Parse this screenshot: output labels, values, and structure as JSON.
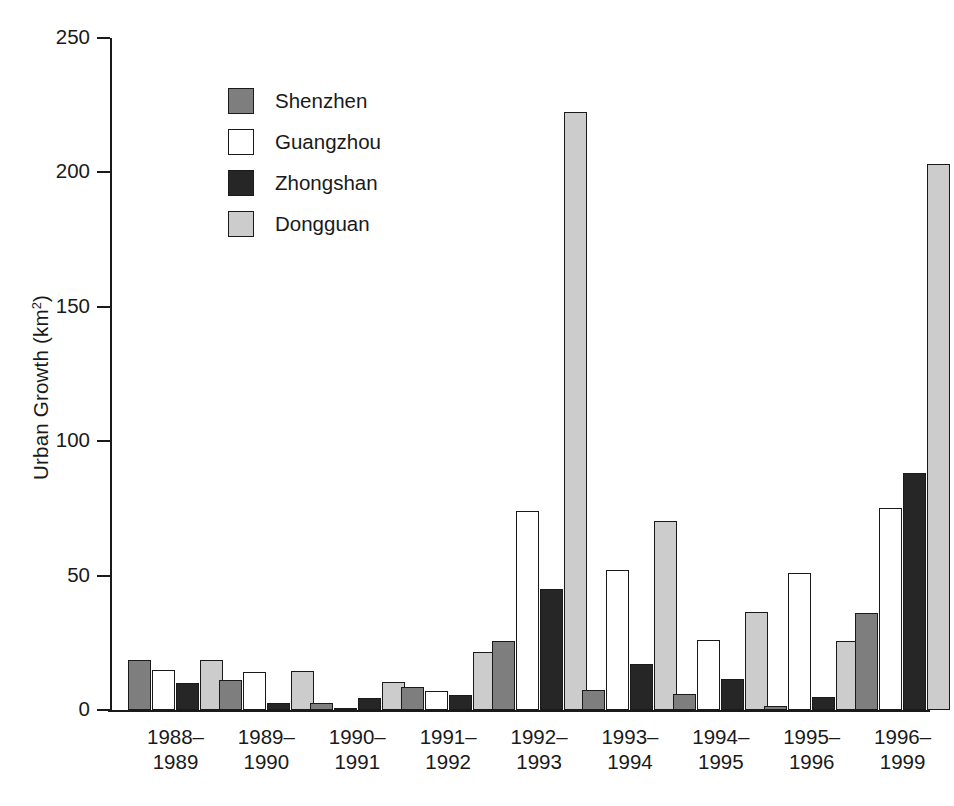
{
  "chart_data": {
    "type": "bar",
    "title": "",
    "xlabel": "",
    "ylabel": "Urban Growth (km2)",
    "ylabel_base": "Urban Growth (km",
    "ylabel_sup": "2",
    "ylabel_tail": ")",
    "ylim": [
      0,
      250
    ],
    "ytick_values": [
      0,
      50,
      100,
      150,
      200,
      250
    ],
    "ytick_labels": [
      "0",
      "50",
      "100",
      "150",
      "200",
      "250"
    ],
    "grid": false,
    "legend_position": "upper-left-inside",
    "categories": [
      "1988–\n1989",
      "1989–\n1990",
      "1990–\n1991",
      "1991–\n1992",
      "1992–\n1993",
      "1993–\n1994",
      "1994–\n1995",
      "1995–\n1996",
      "1996–\n1999"
    ],
    "series": [
      {
        "name": "Shenzhen",
        "color": "#7e7e7e",
        "values": [
          18.5,
          11.0,
          2.5,
          8.5,
          25.5,
          7.5,
          6.0,
          1.5,
          36.0
        ]
      },
      {
        "name": "Guangzhou",
        "color": "#ffffff",
        "values": [
          15.0,
          14.0,
          0.5,
          7.0,
          74.0,
          52.0,
          26.0,
          51.0,
          75.0
        ]
      },
      {
        "name": "Zhongshan",
        "color": "#262626",
        "values": [
          10.0,
          2.5,
          4.5,
          5.5,
          45.0,
          17.0,
          11.5,
          5.0,
          88.0
        ]
      },
      {
        "name": "Dongguan",
        "color": "#cccccc",
        "values": [
          18.5,
          14.5,
          10.5,
          21.5,
          222.5,
          70.5,
          36.5,
          25.5,
          203.0
        ]
      }
    ]
  },
  "legend": {
    "items": [
      {
        "label": "Shenzhen",
        "swatch_class": "s-shenzhen"
      },
      {
        "label": "Guangzhou",
        "swatch_class": "s-guangzhou"
      },
      {
        "label": "Zhongshan",
        "swatch_class": "s-zhongshan"
      },
      {
        "label": "Dongguan",
        "swatch_class": "s-dongguan"
      }
    ]
  },
  "colors": {
    "axis": "#1a1a1a",
    "background": "#ffffff",
    "shenzhen": "#7e7e7e",
    "guangzhou": "#ffffff",
    "zhongshan": "#262626",
    "dongguan": "#cccccc"
  }
}
